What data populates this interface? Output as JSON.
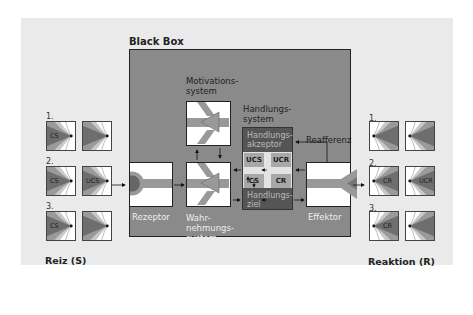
{
  "title": "Black Box",
  "stimulus": {
    "label": "Reiz (S)",
    "rows": [
      {
        "num": "1.",
        "left_text": "CS",
        "right_text": ""
      },
      {
        "num": "2.",
        "left_text": "CS",
        "right_text": "UCS"
      },
      {
        "num": "3.",
        "left_text": "CS",
        "right_text": ""
      }
    ]
  },
  "response": {
    "label": "Reaktion (R)",
    "rows": [
      {
        "num": "1.",
        "left_text": "",
        "right_text": ""
      },
      {
        "num": "2.",
        "left_text": "CR",
        "right_text": "UCR"
      },
      {
        "num": "3.",
        "left_text": "CR",
        "right_text": ""
      }
    ]
  },
  "components": {
    "motivation": "Motivations-\nsystem",
    "perception": "Wahr-\nnehmungs-\nsystem",
    "receptor": "Rezeptor",
    "effector": "Effektor",
    "action_system": "Handlungs-\nsystem",
    "action_acceptor": "Handlungs-\nakzeptor",
    "action_goal": "Handlungs-\nziel",
    "reafference": "Reafferenz"
  },
  "cells": {
    "ucs": "UCS",
    "ucr": "UCR",
    "cs": "CS",
    "cr": "CR"
  },
  "colors": {
    "panel": "#eaeaea",
    "blackbox": "#8a8a8a",
    "dark": "#555555",
    "cell": "#a8a8a8"
  }
}
